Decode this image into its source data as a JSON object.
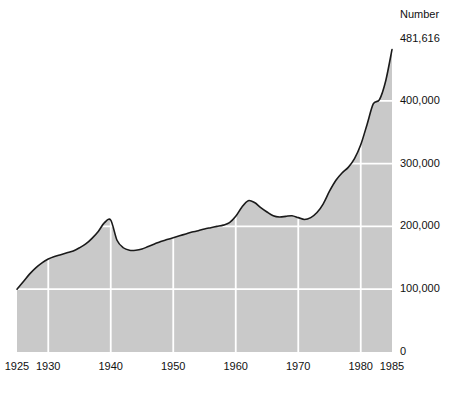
{
  "chart_data": {
    "type": "area",
    "title": "",
    "unit_label": "Number",
    "top_annotation": "481,616",
    "xlabel": "",
    "ylabel": "",
    "xlim": [
      1925,
      1985
    ],
    "ylim": [
      0,
      500000
    ],
    "grid": true,
    "legend": null,
    "fill_color": "#c9c9c9",
    "line_color": "#1a1a1a",
    "grid_color": "#ffffff",
    "y_ticks": [
      {
        "value": 0,
        "label": "0"
      },
      {
        "value": 100000,
        "label": "100,000"
      },
      {
        "value": 200000,
        "label": "200,000"
      },
      {
        "value": 300000,
        "label": "300,000"
      },
      {
        "value": 400000,
        "label": "400,000"
      }
    ],
    "x_ticks": [
      {
        "value": 1925,
        "label": "1925"
      },
      {
        "value": 1930,
        "label": "1930"
      },
      {
        "value": 1940,
        "label": "1940"
      },
      {
        "value": 1950,
        "label": "1950"
      },
      {
        "value": 1960,
        "label": "1960"
      },
      {
        "value": 1970,
        "label": "1970"
      },
      {
        "value": 1980,
        "label": "1980"
      },
      {
        "value": 1985,
        "label": "1985"
      }
    ],
    "x_gridlines": [
      1930,
      1940,
      1950,
      1960,
      1970,
      1980
    ],
    "y_gridlines": [
      100000,
      200000,
      300000,
      400000
    ],
    "x": [
      1925,
      1926,
      1927,
      1928,
      1929,
      1930,
      1931,
      1932,
      1933,
      1934,
      1935,
      1936,
      1937,
      1938,
      1939,
      1940,
      1941,
      1942,
      1943,
      1944,
      1945,
      1946,
      1947,
      1948,
      1949,
      1950,
      1951,
      1952,
      1953,
      1954,
      1955,
      1956,
      1957,
      1958,
      1959,
      1960,
      1961,
      1962,
      1963,
      1964,
      1965,
      1966,
      1967,
      1968,
      1969,
      1970,
      1971,
      1972,
      1973,
      1974,
      1975,
      1976,
      1977,
      1978,
      1979,
      1980,
      1981,
      1982,
      1983,
      1984,
      1985
    ],
    "values": [
      100000,
      112000,
      124000,
      134000,
      142000,
      148000,
      152000,
      155000,
      158000,
      161000,
      166000,
      172000,
      181000,
      192000,
      206000,
      210000,
      178000,
      166000,
      162000,
      162000,
      164000,
      168000,
      172000,
      176000,
      179000,
      182000,
      185000,
      188000,
      191000,
      193000,
      196000,
      198000,
      200000,
      202000,
      206000,
      216000,
      231000,
      241000,
      238000,
      230000,
      223000,
      217000,
      215000,
      216000,
      217000,
      214000,
      211000,
      214000,
      222000,
      236000,
      256000,
      273000,
      285000,
      294000,
      308000,
      330000,
      362000,
      395000,
      402000,
      432000,
      481616
    ]
  }
}
